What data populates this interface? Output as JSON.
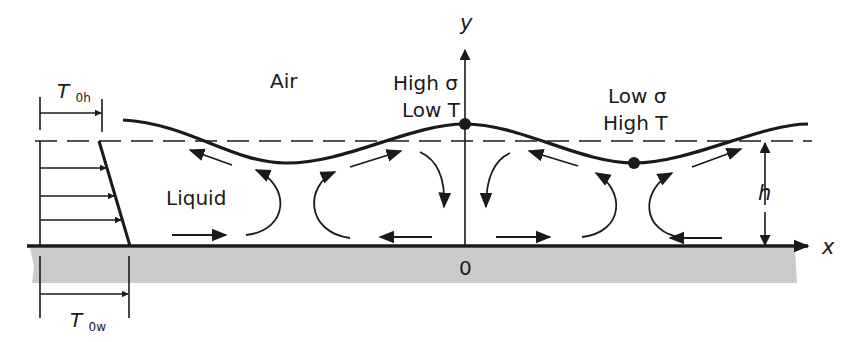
{
  "diagram": {
    "regions": {
      "air_label": "Air",
      "liquid_label": "Liquid"
    },
    "axes": {
      "y_label": "y",
      "x_label": "x",
      "origin_label": "0",
      "thickness_label": "h"
    },
    "annotations": {
      "peak_line1": "High σ",
      "peak_line2": "Low T",
      "trough_line1": "Low σ",
      "trough_line2": "High T"
    },
    "temperature_labels": {
      "top": {
        "main": "T",
        "sub": "0h"
      },
      "wall": {
        "main": "T",
        "sub": "0w"
      }
    },
    "colors": {
      "ink": "#1a1a1a",
      "substrate": "#c9c9c9",
      "background": "#ffffff"
    }
  }
}
